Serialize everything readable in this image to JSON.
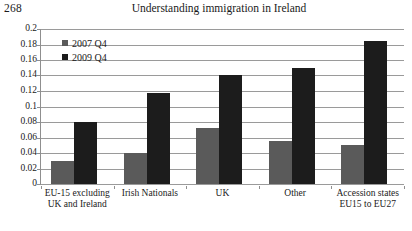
{
  "page": {
    "number": "268"
  },
  "header": {
    "title": "Understanding immigration in Ireland"
  },
  "chart_data": {
    "type": "bar",
    "title": "Understanding immigration in Ireland",
    "xlabel": "",
    "ylabel": "",
    "ylim": [
      0,
      0.2
    ],
    "grid": true,
    "legend_position": "inside-top-left",
    "categories": [
      "EU-15 excluding UK and Ireland",
      "Irish Nationals",
      "UK",
      "Other",
      "Accession states EU15 to EU27"
    ],
    "category_lines": [
      [
        "EU-15 excluding",
        "UK and Ireland"
      ],
      [
        "Irish Nationals"
      ],
      [
        "UK"
      ],
      [
        "Other"
      ],
      [
        "Accession states",
        "EU15 to EU27"
      ]
    ],
    "series": [
      {
        "name": "2007 Q4",
        "color": "#5a5a5a",
        "values": [
          0.03,
          0.04,
          0.072,
          0.055,
          0.05
        ]
      },
      {
        "name": "2009 Q4",
        "color": "#1c1c1c",
        "values": [
          0.08,
          0.118,
          0.14,
          0.15,
          0.185
        ]
      }
    ],
    "y_ticks": [
      "0.2",
      "0.18",
      "0.16",
      "0.14",
      "0.12",
      "0.1",
      "0.08",
      "0.06",
      "0.04",
      "0.02",
      "0"
    ],
    "y_tick_values": [
      0.2,
      0.18,
      0.16,
      0.14,
      0.12,
      0.1,
      0.08,
      0.06,
      0.04,
      0.02,
      0
    ]
  }
}
